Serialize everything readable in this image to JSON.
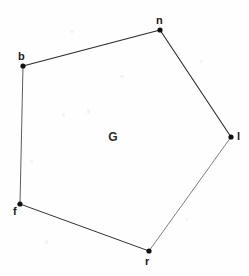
{
  "figure": {
    "kind": "polygon-diagram",
    "width": 249,
    "height": 276,
    "background_color": "#fefefe",
    "interior_label": "G",
    "stroke_color": "#2b2b2b",
    "light_stroke_color": "#6f6f6f",
    "vertex_color": "#111111",
    "label_color": "#1a1a1a"
  },
  "chart_data": {
    "type": "scatter",
    "title": "G",
    "xlabel": "",
    "ylabel": "",
    "xlim": [
      0,
      249
    ],
    "ylim": [
      276,
      0
    ],
    "grid": false,
    "legend": "none",
    "annotations": [
      "G"
    ],
    "nodes": [
      {
        "id": "n",
        "label": "n",
        "x": 160,
        "y": 30,
        "label_x": 156,
        "label_y": 15,
        "label_color": "#1a1a1a"
      },
      {
        "id": "b",
        "label": "b",
        "x": 23,
        "y": 66,
        "label_x": 18,
        "label_y": 51,
        "label_color": "#1a1a1a"
      },
      {
        "id": "l",
        "label": "l",
        "x": 231,
        "y": 137,
        "label_x": 237,
        "label_y": 131,
        "label_color": "#1a1a1a"
      },
      {
        "id": "f",
        "label": "f",
        "x": 20,
        "y": 204,
        "label_x": 13,
        "label_y": 206,
        "label_color": "#1a1a1a"
      },
      {
        "id": "r",
        "label": "r",
        "x": 149,
        "y": 251,
        "label_x": 145,
        "label_y": 256,
        "label_color": "#1a1a1a"
      }
    ],
    "edges": [
      {
        "id": "b-n",
        "from": "b",
        "to": "n",
        "x1": 23,
        "y1": 66,
        "x2": 160,
        "y2": 30,
        "width": 1.1,
        "color": "#2b2b2b"
      },
      {
        "id": "n-l",
        "from": "n",
        "to": "l",
        "x1": 160,
        "y1": 30,
        "x2": 231,
        "y2": 137,
        "width": 1.1,
        "color": "#2b2b2b"
      },
      {
        "id": "l-r",
        "from": "l",
        "to": "r",
        "x1": 231,
        "y1": 137,
        "x2": 149,
        "y2": 251,
        "width": 0.9,
        "color": "#6f6f6f"
      },
      {
        "id": "r-f",
        "from": "r",
        "to": "f",
        "x1": 149,
        "y1": 251,
        "x2": 20,
        "y2": 204,
        "width": 1.0,
        "color": "#333333"
      },
      {
        "id": "f-b",
        "from": "f",
        "to": "b",
        "x1": 20,
        "y1": 204,
        "x2": 23,
        "y2": 66,
        "width": 0.9,
        "color": "#4a4a4a"
      }
    ],
    "interior_label": {
      "text": "G",
      "x": 113,
      "y": 137
    },
    "vertex_radius": 2.6
  },
  "specks": [
    {
      "x": 62,
      "y": 113,
      "w": 3,
      "h": 4
    },
    {
      "x": 87,
      "y": 109,
      "w": 3,
      "h": 5
    },
    {
      "x": 70,
      "y": 30,
      "w": 4,
      "h": 3
    },
    {
      "x": 200,
      "y": 60,
      "w": 3,
      "h": 3
    },
    {
      "x": 45,
      "y": 240,
      "w": 3,
      "h": 4
    },
    {
      "x": 185,
      "y": 218,
      "w": 3,
      "h": 3
    },
    {
      "x": 120,
      "y": 75,
      "w": 4,
      "h": 3
    },
    {
      "x": 30,
      "y": 160,
      "w": 3,
      "h": 3
    }
  ]
}
